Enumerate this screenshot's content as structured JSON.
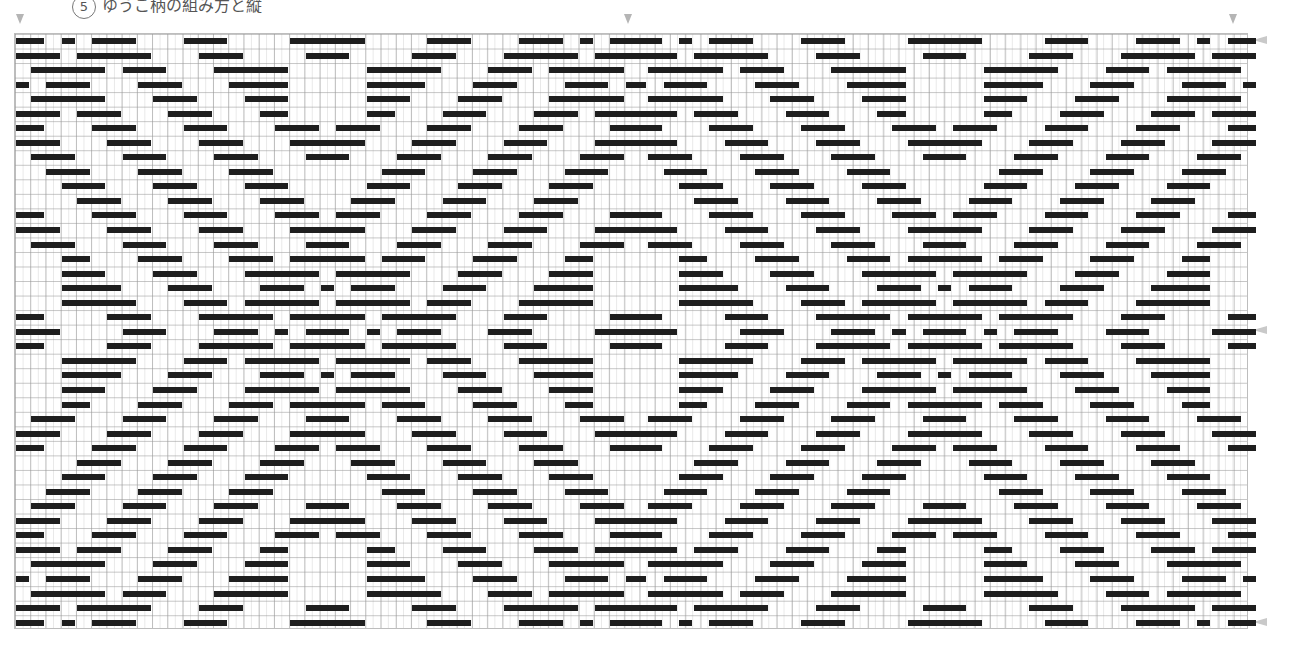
{
  "caption": {
    "number": "5",
    "text": "ゆうこ柄の組み方と縦"
  },
  "pattern": {
    "unit_px": 7.62,
    "row_px": 14.54,
    "repeat_units": 81,
    "repeats": 2,
    "bar_color": "#1e1e1e",
    "rows_top_half": [
      [
        [
          0,
          4
        ],
        [
          6,
          2
        ],
        [
          10,
          6
        ],
        [
          22,
          6
        ],
        [
          36,
          10
        ],
        [
          54,
          6
        ],
        [
          66,
          6
        ],
        [
          74,
          2
        ],
        [
          78,
          4
        ]
      ],
      [
        [
          0,
          6
        ],
        [
          8,
          10
        ],
        [
          24,
          6
        ],
        [
          38,
          6
        ],
        [
          52,
          6
        ],
        [
          64,
          10
        ],
        [
          76,
          6
        ]
      ],
      [
        [
          2,
          10
        ],
        [
          14,
          6
        ],
        [
          26,
          10
        ],
        [
          46,
          10
        ],
        [
          62,
          6
        ],
        [
          70,
          10
        ]
      ],
      [
        [
          0,
          2
        ],
        [
          4,
          6
        ],
        [
          16,
          6
        ],
        [
          28,
          8
        ],
        [
          46,
          8
        ],
        [
          60,
          6
        ],
        [
          72,
          6
        ],
        [
          80,
          2
        ]
      ],
      [
        [
          2,
          10
        ],
        [
          18,
          6
        ],
        [
          30,
          6
        ],
        [
          46,
          6
        ],
        [
          58,
          6
        ],
        [
          70,
          10
        ]
      ],
      [
        [
          0,
          6
        ],
        [
          8,
          6
        ],
        [
          20,
          6
        ],
        [
          32,
          4
        ],
        [
          46,
          4
        ],
        [
          56,
          6
        ],
        [
          68,
          6
        ],
        [
          76,
          6
        ]
      ],
      [
        [
          0,
          4
        ],
        [
          10,
          6
        ],
        [
          22,
          6
        ],
        [
          34,
          6
        ],
        [
          42,
          6
        ],
        [
          54,
          6
        ],
        [
          66,
          6
        ],
        [
          78,
          4
        ]
      ],
      [
        [
          0,
          6
        ],
        [
          12,
          6
        ],
        [
          24,
          6
        ],
        [
          36,
          10
        ],
        [
          52,
          6
        ],
        [
          64,
          6
        ],
        [
          76,
          6
        ]
      ],
      [
        [
          2,
          6
        ],
        [
          14,
          6
        ],
        [
          26,
          6
        ],
        [
          38,
          6
        ],
        [
          50,
          6
        ],
        [
          62,
          6
        ],
        [
          74,
          6
        ]
      ],
      [
        [
          4,
          6
        ],
        [
          16,
          6
        ],
        [
          28,
          6
        ],
        [
          48,
          6
        ],
        [
          60,
          6
        ],
        [
          72,
          6
        ]
      ],
      [
        [
          6,
          6
        ],
        [
          18,
          6
        ],
        [
          30,
          6
        ],
        [
          46,
          6
        ],
        [
          58,
          6
        ],
        [
          70,
          6
        ]
      ],
      [
        [
          8,
          6
        ],
        [
          20,
          6
        ],
        [
          32,
          6
        ],
        [
          44,
          6
        ],
        [
          56,
          6
        ],
        [
          68,
          6
        ]
      ],
      [
        [
          0,
          4
        ],
        [
          10,
          6
        ],
        [
          22,
          6
        ],
        [
          34,
          6
        ],
        [
          42,
          6
        ],
        [
          54,
          6
        ],
        [
          66,
          6
        ],
        [
          78,
          4
        ]
      ],
      [
        [
          0,
          6
        ],
        [
          12,
          6
        ],
        [
          24,
          6
        ],
        [
          36,
          10
        ],
        [
          52,
          6
        ],
        [
          64,
          6
        ],
        [
          76,
          6
        ]
      ],
      [
        [
          2,
          6
        ],
        [
          14,
          6
        ],
        [
          26,
          6
        ],
        [
          38,
          6
        ],
        [
          50,
          6
        ],
        [
          62,
          6
        ],
        [
          74,
          6
        ]
      ],
      [
        [
          6,
          4
        ],
        [
          16,
          6
        ],
        [
          28,
          6
        ],
        [
          36,
          10
        ],
        [
          48,
          6
        ],
        [
          60,
          6
        ],
        [
          72,
          4
        ]
      ],
      [
        [
          6,
          6
        ],
        [
          18,
          6
        ],
        [
          30,
          10
        ],
        [
          42,
          10
        ],
        [
          58,
          6
        ],
        [
          70,
          6
        ]
      ],
      [
        [
          6,
          8
        ],
        [
          20,
          6
        ],
        [
          32,
          6
        ],
        [
          40,
          2
        ],
        [
          44,
          6
        ],
        [
          56,
          6
        ],
        [
          68,
          8
        ]
      ],
      [
        [
          6,
          10
        ],
        [
          22,
          6
        ],
        [
          30,
          10
        ],
        [
          42,
          10
        ],
        [
          54,
          6
        ],
        [
          66,
          10
        ]
      ],
      [
        [
          0,
          4
        ],
        [
          12,
          6
        ],
        [
          24,
          10
        ],
        [
          36,
          10
        ],
        [
          48,
          10
        ],
        [
          64,
          6
        ],
        [
          78,
          4
        ]
      ],
      [
        [
          0,
          6
        ],
        [
          14,
          6
        ],
        [
          26,
          6
        ],
        [
          34,
          2
        ],
        [
          38,
          6
        ],
        [
          46,
          2
        ],
        [
          50,
          6
        ],
        [
          62,
          6
        ],
        [
          76,
          6
        ]
      ]
    ],
    "mirror_vertical": true
  },
  "markers": {
    "top_x": [
      20,
      628,
      1233
    ],
    "side_y": [
      40,
      330,
      622
    ],
    "color": "#b5b5b5"
  }
}
